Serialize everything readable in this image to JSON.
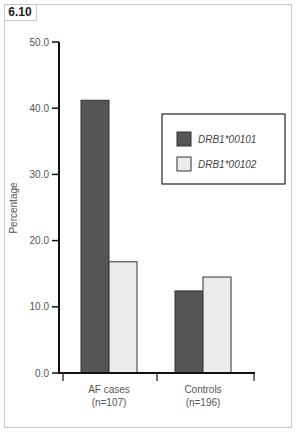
{
  "figure_label": "6.10",
  "colors": {
    "series1": "#555555",
    "series2": "#ebebeb",
    "axis": "#111111"
  },
  "chart_data": {
    "type": "bar",
    "title": "",
    "xlabel": "",
    "ylabel": "Percentage",
    "ylim": [
      0,
      50
    ],
    "yticks": [
      "0.0",
      "10.0",
      "20.0",
      "30.0",
      "40.0",
      "50.0"
    ],
    "grid": false,
    "legend_position": "upper right (inside)",
    "categories": [
      "AF cases\n(n=107)",
      "Controls\n(n=196)"
    ],
    "category_lines": [
      [
        "AF cases",
        "(n=107)"
      ],
      [
        "Controls",
        "(n=196)"
      ]
    ],
    "series": [
      {
        "name": "DRB1*00101",
        "values": [
          41.2,
          12.4
        ]
      },
      {
        "name": "DRB1*00102",
        "values": [
          16.8,
          14.5
        ]
      }
    ]
  }
}
